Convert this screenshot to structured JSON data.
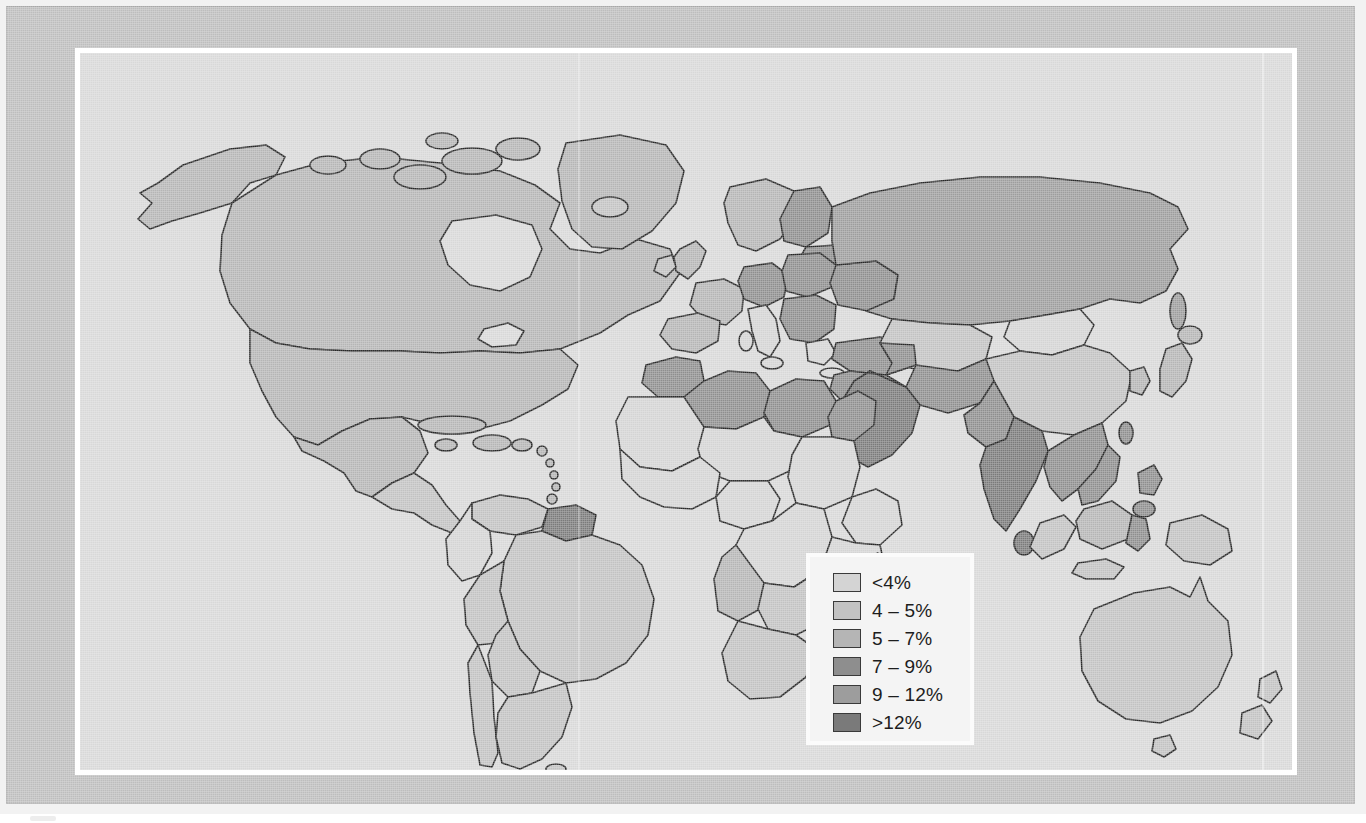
{
  "figure": {
    "type": "choropleth-world-map",
    "background_color": "#bdbdbd",
    "map_field_color": "#d8d8d8",
    "frame_color": "#ffffff",
    "outline_color": "#262626"
  },
  "legend": {
    "name": "map-legend",
    "background_color": "#f4f4f4",
    "items": [
      {
        "label": "<4%",
        "color": "#d4d4d4"
      },
      {
        "label": "4 – 5%",
        "color": "#c2c2c2"
      },
      {
        "label": "5 – 7%",
        "color": "#b5b5b5"
      },
      {
        "label": "7 – 9%",
        "color": "#8e8e8e"
      },
      {
        "label": "9 – 12%",
        "color": "#9d9d9d"
      },
      {
        "label": ">12%",
        "color": "#7a7a7a"
      }
    ]
  },
  "chart_data": {
    "type": "heatmap",
    "title": "",
    "subtitle": "",
    "xlabel": "",
    "ylabel": "",
    "legend_position": "inside-bottom-right",
    "grid": false,
    "value_unit": "%",
    "classes": [
      {
        "label": "<4%",
        "min": null,
        "max": 4,
        "color": "#d4d4d4"
      },
      {
        "label": "4 – 5%",
        "min": 4,
        "max": 5,
        "color": "#c2c2c2"
      },
      {
        "label": "5 – 7%",
        "min": 5,
        "max": 7,
        "color": "#b5b5b5"
      },
      {
        "label": "7 – 9%",
        "min": 7,
        "max": 9,
        "color": "#8e8e8e"
      },
      {
        "label": "9 – 12%",
        "min": 9,
        "max": 12,
        "color": "#9d9d9d"
      },
      {
        "label": ">12%",
        "min": 12,
        "max": null,
        "color": "#7a7a7a"
      }
    ],
    "regions": [
      {
        "name": "Canada",
        "class": "5 – 7%"
      },
      {
        "name": "United States",
        "class": "5 – 7%"
      },
      {
        "name": "Alaska",
        "class": "5 – 7%"
      },
      {
        "name": "Greenland",
        "class": "5 – 7%"
      },
      {
        "name": "Mexico",
        "class": "5 – 7%"
      },
      {
        "name": "Central America",
        "class": "4 – 5%"
      },
      {
        "name": "Caribbean",
        "class": "5 – 7%"
      },
      {
        "name": "Colombia",
        "class": "<4%"
      },
      {
        "name": "Venezuela",
        "class": "4 – 5%"
      },
      {
        "name": "Guyana / Suriname",
        "class": ">12%"
      },
      {
        "name": "Brazil",
        "class": "4 – 5%"
      },
      {
        "name": "Peru",
        "class": "4 – 5%"
      },
      {
        "name": "Bolivia",
        "class": "4 – 5%"
      },
      {
        "name": "Chile",
        "class": "4 – 5%"
      },
      {
        "name": "Argentina",
        "class": "4 – 5%"
      },
      {
        "name": "United Kingdom",
        "class": "5 – 7%"
      },
      {
        "name": "Scandinavia",
        "class": "5 – 7%"
      },
      {
        "name": "France",
        "class": "5 – 7%"
      },
      {
        "name": "Spain",
        "class": "5 – 7%"
      },
      {
        "name": "Germany / Poland",
        "class": "7 – 9%"
      },
      {
        "name": "Italy",
        "class": "<4%"
      },
      {
        "name": "Balkans",
        "class": "7 – 9%"
      },
      {
        "name": "Turkey",
        "class": "7 – 9%"
      },
      {
        "name": "Russia",
        "class": "9 – 12%"
      },
      {
        "name": "Kazakhstan",
        "class": "4 – 5%"
      },
      {
        "name": "Mongolia",
        "class": "<4%"
      },
      {
        "name": "China",
        "class": "4 – 5%"
      },
      {
        "name": "Japan",
        "class": "5 – 7%"
      },
      {
        "name": "Korea",
        "class": "5 – 7%"
      },
      {
        "name": "Morocco / Algeria",
        "class": "7 – 9%"
      },
      {
        "name": "Libya",
        "class": "7 – 9%"
      },
      {
        "name": "Egypt",
        "class": "7 – 9%"
      },
      {
        "name": "Saudi Arabia",
        "class": ">12%"
      },
      {
        "name": "Iran",
        "class": "7 – 9%"
      },
      {
        "name": "Pakistan",
        "class": "7 – 9%"
      },
      {
        "name": "India",
        "class": ">12%"
      },
      {
        "name": "Sri Lanka",
        "class": ">12%"
      },
      {
        "name": "West Africa",
        "class": "<4%"
      },
      {
        "name": "Central Africa",
        "class": "<4%"
      },
      {
        "name": "East Africa",
        "class": "<4%"
      },
      {
        "name": "Southern Africa",
        "class": "4 – 5%"
      },
      {
        "name": "Madagascar",
        "class": "<4%"
      },
      {
        "name": "Indochina",
        "class": "7 – 9%"
      },
      {
        "name": "Philippines",
        "class": "7 – 9%"
      },
      {
        "name": "Indonesia",
        "class": "4 – 5%"
      },
      {
        "name": "Papua New Guinea",
        "class": "4 – 5%"
      },
      {
        "name": "Australia",
        "class": "4 – 5%"
      },
      {
        "name": "New Zealand",
        "class": "4 – 5%"
      }
    ]
  }
}
